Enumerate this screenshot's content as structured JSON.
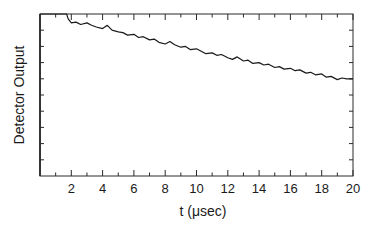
{
  "chart_data": {
    "type": "line",
    "title": "",
    "xlabel": "t (μsec)",
    "ylabel": "Detector Output",
    "xlim": [
      0,
      20
    ],
    "ylim": [
      0,
      10
    ],
    "x_ticks_major": [
      2,
      4,
      6,
      8,
      10,
      12,
      14,
      16,
      18,
      20
    ],
    "x_tick_labels": [
      "2",
      "4",
      "6",
      "8",
      "10",
      "12",
      "14",
      "16",
      "18",
      "20"
    ],
    "x_ticks_minor": [
      1,
      3,
      5,
      7,
      9,
      11,
      13,
      15,
      17,
      19
    ],
    "y_ticks": [
      1,
      2,
      3,
      4,
      5,
      6,
      7,
      8,
      9
    ],
    "y_tick_labels": [],
    "grid": false,
    "legend": null,
    "series": [
      {
        "name": "Detector Output",
        "x": [
          0,
          0.5,
          1.0,
          1.5,
          1.7,
          1.8,
          2.0,
          2.3,
          2.6,
          3.0,
          3.3,
          3.6,
          4.0,
          4.3,
          4.6,
          5.0,
          5.3,
          5.6,
          6.0,
          6.3,
          6.6,
          7.0,
          7.3,
          7.6,
          8.0,
          8.3,
          8.6,
          9.0,
          9.3,
          9.6,
          10.0,
          10.3,
          10.6,
          11.0,
          11.3,
          11.6,
          12.0,
          12.3,
          12.6,
          13.0,
          13.3,
          13.6,
          14.0,
          14.3,
          14.6,
          15.0,
          15.3,
          15.6,
          16.0,
          16.3,
          16.6,
          17.0,
          17.3,
          17.6,
          18.0,
          18.3,
          18.6,
          19.0,
          19.3,
          19.6,
          20.0
        ],
        "y": [
          10.0,
          10.0,
          10.0,
          10.0,
          10.0,
          9.7,
          9.45,
          9.5,
          9.35,
          9.45,
          9.3,
          9.2,
          9.1,
          9.3,
          9.0,
          8.9,
          8.85,
          8.7,
          8.75,
          8.55,
          8.6,
          8.4,
          8.45,
          8.25,
          8.15,
          8.3,
          8.1,
          7.95,
          8.0,
          7.8,
          7.85,
          7.7,
          7.55,
          7.6,
          7.45,
          7.5,
          7.3,
          7.2,
          7.35,
          7.1,
          7.15,
          6.95,
          7.0,
          6.85,
          6.9,
          6.7,
          6.75,
          6.6,
          6.65,
          6.5,
          6.55,
          6.35,
          6.4,
          6.25,
          6.3,
          6.1,
          6.15,
          5.95,
          6.05,
          6.0,
          6.0
        ]
      }
    ],
    "annotations": []
  }
}
